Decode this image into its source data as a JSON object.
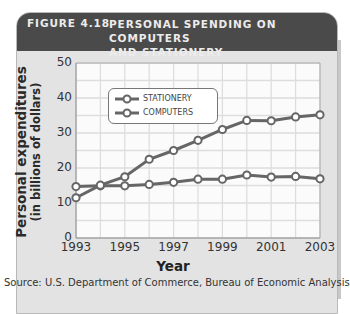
{
  "figure": {
    "number": "FIGURE 4.18",
    "title": "PERSONAL SPENDING ON COMPUTERS AND STATIONERY",
    "title_line1": "PERSONAL SPENDING ON COMPUTERS",
    "title_line2": "AND STATIONERY",
    "source": "Source: U.S. Department of Commerce, Bureau of Economic Analysis"
  },
  "chart_data": {
    "type": "line",
    "title": "Personal Spending on Computers and Stationery",
    "xlabel": "Year",
    "ylabel": "Personal expenditures (in billions of dollars)",
    "ylabel_line1": "Personal expenditures",
    "ylabel_line2": "(in billions of dollars)",
    "x": [
      1993,
      1994,
      1995,
      1996,
      1997,
      1998,
      1999,
      2000,
      2001,
      2002,
      2003
    ],
    "x_tick_labels": [
      "1993",
      "1995",
      "1997",
      "1999",
      "2001",
      "2003"
    ],
    "y_tick_labels": [
      "0",
      "10",
      "20",
      "30",
      "40",
      "50"
    ],
    "ylim": [
      0,
      50
    ],
    "xlim": [
      1993,
      2003
    ],
    "grid": true,
    "legend_position": "upper left",
    "series": [
      {
        "name": "STATIONERY",
        "values": [
          14.7,
          14.9,
          14.9,
          15.3,
          15.9,
          16.8,
          16.8,
          18.0,
          17.4,
          17.6,
          16.9
        ]
      },
      {
        "name": "COMPUTERS",
        "values": [
          11.5,
          15.1,
          17.5,
          22.5,
          25.0,
          27.9,
          31.0,
          33.6,
          33.5,
          34.6,
          35.2
        ]
      }
    ]
  },
  "colors": {
    "title_bar": "#4a4a4a",
    "panel": "#e3e3e3",
    "plot_bg": "#fbfbfb",
    "grid": "#dddddd",
    "line": "#666666"
  }
}
